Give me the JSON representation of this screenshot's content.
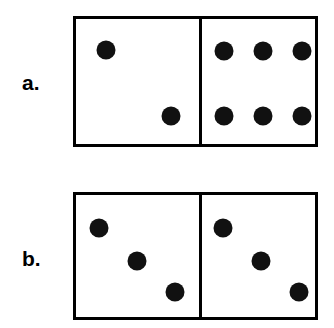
{
  "figure": {
    "background_color": "#ffffff",
    "ink_color": "#000000",
    "pip_color": "#111111",
    "width": 334,
    "height": 328
  },
  "dominoes": [
    {
      "id": "a",
      "label": "a.",
      "label_x": 22,
      "label_y": 72,
      "x": 73,
      "y": 16,
      "width": 245,
      "height": 131,
      "half_width": 123,
      "border": 3,
      "pip_diameter": 19,
      "total_pips": 8,
      "halves": [
        {
          "side": "left",
          "pip_count": 2,
          "arrangement": "diagonal",
          "pips": [
            {
              "cx": 30,
              "cy": 31
            },
            {
              "cx": 95,
              "cy": 97
            }
          ]
        },
        {
          "side": "right",
          "pip_count": 6,
          "arrangement": "grid-3x2",
          "pips": [
            {
              "cx": 22,
              "cy": 32
            },
            {
              "cx": 61,
              "cy": 32
            },
            {
              "cx": 100,
              "cy": 32
            },
            {
              "cx": 22,
              "cy": 97
            },
            {
              "cx": 61,
              "cy": 97
            },
            {
              "cx": 100,
              "cy": 97
            }
          ]
        }
      ]
    },
    {
      "id": "b",
      "label": "b.",
      "label_x": 22,
      "label_y": 248,
      "x": 73,
      "y": 192,
      "width": 245,
      "height": 128,
      "half_width": 123,
      "border": 3,
      "pip_diameter": 19,
      "total_pips": 6,
      "halves": [
        {
          "side": "left",
          "pip_count": 3,
          "arrangement": "diagonal",
          "pips": [
            {
              "cx": 23,
              "cy": 33
            },
            {
              "cx": 61,
              "cy": 66
            },
            {
              "cx": 99,
              "cy": 97
            }
          ]
        },
        {
          "side": "right",
          "pip_count": 3,
          "arrangement": "diagonal",
          "pips": [
            {
              "cx": 21,
              "cy": 33
            },
            {
              "cx": 59,
              "cy": 66
            },
            {
              "cx": 97,
              "cy": 97
            }
          ]
        }
      ]
    }
  ]
}
